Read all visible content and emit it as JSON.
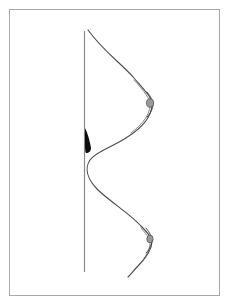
{
  "figure": {
    "title": "",
    "background_color": "#ffffff",
    "canvas": {
      "width": 230,
      "height": 307
    },
    "border": {
      "name": "figure-border",
      "color": "#a8a8a8",
      "stroke_width": 1,
      "x": 9.5,
      "y": 9.5,
      "width": 210,
      "height": 286
    },
    "axis_line": {
      "name": "vertical-axis-line",
      "color": "#8a8a8a",
      "stroke_width": 1.2,
      "x": 84.5,
      "y_top": 31,
      "y_bottom": 272
    },
    "main_curve": {
      "name": "sinuous-profile-curve",
      "color": "#4a4a4a",
      "stroke_width": 1.1,
      "fill": "none",
      "path": "M 88 30 C 104 52, 120 62, 134 78 C 146 92, 152 98, 152 104 C 152 116, 142 128, 126 138 C 108 149, 96 152, 90 160 C 84 169, 88 180, 98 190 C 112 203, 130 214, 141 226 C 149 234, 152 238, 152 241 C 152 249, 146 258, 138 266 C 134 270, 131 274, 128 277"
    },
    "shadow_curve": {
      "name": "inner-shadow-curve",
      "color": "#6f6f6f",
      "stroke_width": 0.8,
      "path": "M 134 80 C 145 92, 150 99, 150 105 C 150 114, 143 124, 131 133 M 141 228 C 148 236, 150 240, 150 243 C 150 250, 145 258, 139 265"
    },
    "black_teardrop": {
      "name": "black-teardrop-marker",
      "fill": "#0d0d0d",
      "path": "M 85 128 C 88 134, 90 142, 91 148 C 91 151, 89 153, 86 153 C 85 152, 85 148, 85 143 Z"
    },
    "cusps": [
      {
        "name": "upper-bulge-cusp",
        "fill": "#9a9a9a",
        "stroke": "#4a4a4a",
        "cx": 150,
        "cy": 103,
        "rx": 3.6,
        "ry": 4.2
      },
      {
        "name": "lower-bulge-cusp",
        "fill": "#9a9a9a",
        "stroke": "#4a4a4a",
        "cx": 150,
        "cy": 239,
        "rx": 3.2,
        "ry": 3.8
      }
    ],
    "cusp_tails": [
      {
        "name": "upper-cusp-tail",
        "color": "#3a3a3a",
        "path": "M 147 92 C 151 97, 153 101, 153 104 C 153 108, 151 113, 147 117"
      },
      {
        "name": "lower-cusp-tail",
        "color": "#3a3a3a",
        "path": "M 146 228 C 150 233, 152 237, 152 240 C 152 244, 150 249, 146 253"
      }
    ],
    "labels": {
      "caption": "",
      "annotations": []
    }
  }
}
